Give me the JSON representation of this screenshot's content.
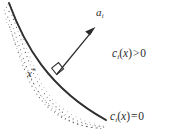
{
  "figure": {
    "kind": "constraint-boundary-diagram",
    "background_color": "#ffffff",
    "ink_color": "#2b2b2b",
    "width": 170,
    "height": 138
  },
  "labels": {
    "gradient_vector": {
      "name": "a",
      "subscript": "i",
      "full_text": "a_i"
    },
    "point": {
      "name": "x",
      "superscript": "*",
      "full_text": "x*"
    },
    "feasible_region": {
      "func": "c",
      "subscript": "i",
      "open_paren": "(",
      "arg": "x",
      "close_paren": ")",
      "relation": ">",
      "value": "0",
      "full_text": "c_i(x) > 0"
    },
    "boundary": {
      "func": "c",
      "subscript": "i",
      "open_paren": "(",
      "arg": "x",
      "close_paren": ")",
      "relation": "=",
      "value": "0",
      "full_text": "c_i(x) = 0"
    }
  },
  "geometry": {
    "curve": {
      "description": "constraint boundary arc, concave toward upper-right",
      "start": [
        9,
        3
      ],
      "control_1": [
        30,
        55
      ],
      "control_2": [
        62,
        98
      ],
      "end": [
        106,
        120
      ]
    },
    "arrow": {
      "description": "outward normal gradient vector at x*",
      "tail": [
        57,
        74
      ],
      "tip": [
        95,
        28
      ]
    },
    "right_angle_marker": {
      "at": [
        57,
        74
      ],
      "size": 9
    },
    "stipple": {
      "description": "dotted shading on infeasible side (left/below the curve)",
      "dot_count": 150
    }
  }
}
